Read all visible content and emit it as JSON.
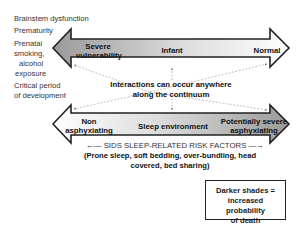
{
  "left_factors": [
    {
      "label": "Brainstem dysfunction"
    },
    {
      "label": "Prematurity"
    },
    {
      "label": "Prenatal"
    },
    {
      "label": "smoking,"
    },
    {
      "label": "alcohol"
    },
    {
      "label": "exposure"
    },
    {
      "label": "Critical period"
    },
    {
      "label": "of development"
    }
  ],
  "top_arrow": {
    "left_label_line1": "Severe",
    "left_label_line2": "vulnerability",
    "center_label": "Infant",
    "right_label": "Normal",
    "gradient_dark": "#9a9a9a",
    "gradient_light": "#ffffff"
  },
  "interactions": {
    "line1": "Interactions can occur anywhere",
    "line2": "along the continuum"
  },
  "bottom_arrow": {
    "left_label_line1": "Non",
    "left_label_line2": "asphyxiating",
    "center_label": "Sleep environment",
    "right_label_line1": "Potentially severe",
    "right_label_line2": "asphyxiating",
    "gradient_dark": "#9a9a9a",
    "gradient_light": "#ffffff"
  },
  "risk_factors": {
    "title": "SIDS SLEEP-RELATED RISK FACTORS",
    "left_arrow": "←—",
    "right_arrow": "—→",
    "details_line1": "(Prone sleep, soft bedding, over-bundling, head",
    "details_line2": "covered, bed sharing)"
  },
  "legend": {
    "line1": "Darker shades =",
    "line2": "increased probability",
    "line3": "of death"
  }
}
